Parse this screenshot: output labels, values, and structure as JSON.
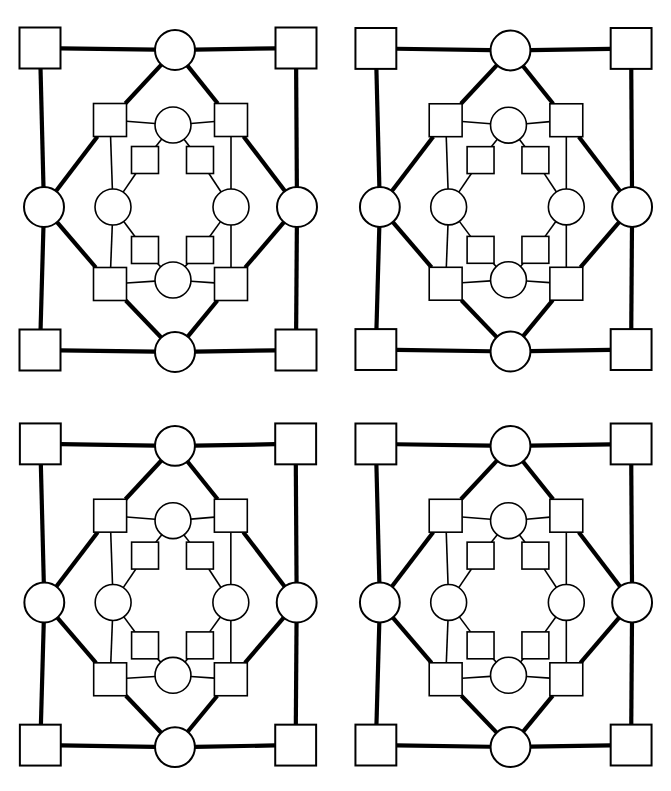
{
  "figure": {
    "title": "",
    "type": "graph-diagram-grid",
    "panel_count": 4,
    "panel_layout": "2x2",
    "background_color": "#ffffff",
    "stroke_color": "#000000",
    "fill_color": "#ffffff"
  },
  "panels": [
    {
      "id": "panel-top-left",
      "label": "",
      "row": 0,
      "col": 0
    },
    {
      "id": "panel-top-right",
      "label": "",
      "row": 0,
      "col": 1
    },
    {
      "id": "panel-bottom-left",
      "label": "",
      "row": 1,
      "col": 0
    },
    {
      "id": "panel-bottom-right",
      "label": "",
      "row": 1,
      "col": 1
    }
  ],
  "chart_data": {
    "type": "diagram",
    "title": "",
    "xlabel": "",
    "ylabel": "",
    "viewbox": [
      0,
      0,
      336,
      396
    ],
    "stroke_thick": 4.2,
    "stroke_thin": 1.6,
    "nodes": [
      {
        "id": "o-nw",
        "shape": "square",
        "cx": 40,
        "cy": 48,
        "size": 41,
        "ring": "outer",
        "label": ""
      },
      {
        "id": "o-ne",
        "shape": "square",
        "cx": 296,
        "cy": 48,
        "size": 41,
        "ring": "outer",
        "label": ""
      },
      {
        "id": "o-sw",
        "shape": "square",
        "cx": 40,
        "cy": 350,
        "size": 41,
        "ring": "outer",
        "label": ""
      },
      {
        "id": "o-se",
        "shape": "square",
        "cx": 296,
        "cy": 350,
        "size": 41,
        "ring": "outer",
        "label": ""
      },
      {
        "id": "o-n",
        "shape": "circle",
        "cx": 175,
        "cy": 50,
        "r": 20,
        "ring": "outer",
        "label": ""
      },
      {
        "id": "o-s",
        "shape": "circle",
        "cx": 175,
        "cy": 352,
        "r": 20,
        "ring": "outer",
        "label": ""
      },
      {
        "id": "o-w",
        "shape": "circle",
        "cx": 44,
        "cy": 207,
        "r": 20,
        "ring": "outer",
        "label": ""
      },
      {
        "id": "o-e",
        "shape": "circle",
        "cx": 297,
        "cy": 207,
        "r": 20,
        "ring": "outer",
        "label": ""
      },
      {
        "id": "m-nw",
        "shape": "square",
        "cx": 110,
        "cy": 120,
        "size": 33,
        "ring": "middle",
        "label": ""
      },
      {
        "id": "m-ne",
        "shape": "square",
        "cx": 231,
        "cy": 120,
        "size": 33,
        "ring": "middle",
        "label": ""
      },
      {
        "id": "m-sw",
        "shape": "square",
        "cx": 110,
        "cy": 284,
        "size": 33,
        "ring": "middle",
        "label": ""
      },
      {
        "id": "m-se",
        "shape": "square",
        "cx": 231,
        "cy": 284,
        "size": 33,
        "ring": "middle",
        "label": ""
      },
      {
        "id": "m-n",
        "shape": "circle",
        "cx": 173,
        "cy": 125,
        "r": 18,
        "ring": "middle",
        "label": ""
      },
      {
        "id": "m-s",
        "shape": "circle",
        "cx": 173,
        "cy": 280,
        "r": 18,
        "ring": "middle",
        "label": ""
      },
      {
        "id": "m-w",
        "shape": "circle",
        "cx": 113,
        "cy": 207,
        "r": 18,
        "ring": "middle",
        "label": ""
      },
      {
        "id": "m-e",
        "shape": "circle",
        "cx": 231,
        "cy": 207,
        "r": 18,
        "ring": "middle",
        "label": ""
      },
      {
        "id": "i-nw",
        "shape": "square",
        "cx": 145,
        "cy": 160,
        "size": 27,
        "ring": "inner",
        "label": ""
      },
      {
        "id": "i-ne",
        "shape": "square",
        "cx": 200,
        "cy": 160,
        "size": 27,
        "ring": "inner",
        "label": ""
      },
      {
        "id": "i-sw",
        "shape": "square",
        "cx": 145,
        "cy": 250,
        "size": 27,
        "ring": "inner",
        "label": ""
      },
      {
        "id": "i-se",
        "shape": "square",
        "cx": 200,
        "cy": 250,
        "size": 27,
        "ring": "inner",
        "label": ""
      }
    ],
    "edges": [
      {
        "from": "o-nw",
        "to": "o-n",
        "weight": "thick"
      },
      {
        "from": "o-n",
        "to": "o-ne",
        "weight": "thick"
      },
      {
        "from": "o-nw",
        "to": "o-w",
        "weight": "thick"
      },
      {
        "from": "o-w",
        "to": "o-sw",
        "weight": "thick"
      },
      {
        "from": "o-ne",
        "to": "o-e",
        "weight": "thick"
      },
      {
        "from": "o-e",
        "to": "o-se",
        "weight": "thick"
      },
      {
        "from": "o-sw",
        "to": "o-s",
        "weight": "thick"
      },
      {
        "from": "o-s",
        "to": "o-se",
        "weight": "thick"
      },
      {
        "from": "o-n",
        "to": "m-nw",
        "weight": "thick"
      },
      {
        "from": "o-n",
        "to": "m-ne",
        "weight": "thick"
      },
      {
        "from": "o-s",
        "to": "m-sw",
        "weight": "thick"
      },
      {
        "from": "o-s",
        "to": "m-se",
        "weight": "thick"
      },
      {
        "from": "o-w",
        "to": "m-nw",
        "weight": "thick"
      },
      {
        "from": "o-w",
        "to": "m-sw",
        "weight": "thick"
      },
      {
        "from": "o-e",
        "to": "m-ne",
        "weight": "thick"
      },
      {
        "from": "o-e",
        "to": "m-se",
        "weight": "thick"
      },
      {
        "from": "m-nw",
        "to": "m-n",
        "weight": "thin"
      },
      {
        "from": "m-n",
        "to": "m-ne",
        "weight": "thin"
      },
      {
        "from": "m-sw",
        "to": "m-s",
        "weight": "thin"
      },
      {
        "from": "m-s",
        "to": "m-se",
        "weight": "thin"
      },
      {
        "from": "m-nw",
        "to": "m-w",
        "weight": "thin"
      },
      {
        "from": "m-sw",
        "to": "m-w",
        "weight": "thin"
      },
      {
        "from": "m-ne",
        "to": "m-e",
        "weight": "thin"
      },
      {
        "from": "m-se",
        "to": "m-e",
        "weight": "thin"
      },
      {
        "from": "m-n",
        "to": "i-nw",
        "weight": "thin"
      },
      {
        "from": "m-n",
        "to": "i-ne",
        "weight": "thin"
      },
      {
        "from": "m-s",
        "to": "i-sw",
        "weight": "thin"
      },
      {
        "from": "m-s",
        "to": "i-se",
        "weight": "thin"
      },
      {
        "from": "m-w",
        "to": "i-nw",
        "weight": "thin"
      },
      {
        "from": "m-w",
        "to": "i-sw",
        "weight": "thin"
      },
      {
        "from": "m-e",
        "to": "i-ne",
        "weight": "thin"
      },
      {
        "from": "m-e",
        "to": "i-se",
        "weight": "thin"
      }
    ]
  }
}
